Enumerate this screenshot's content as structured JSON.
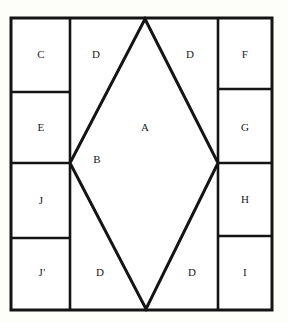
{
  "figure": {
    "type": "geometric-partition-diagram",
    "background_color": "#fdfdfa",
    "stroke_color": "#141414",
    "label_color": "#1a1a1a",
    "outer_border": {
      "x": 11,
      "y": 18,
      "width": 261,
      "height": 292,
      "stroke_width": 3
    },
    "inner_stroke_width": 2.6
  },
  "rhombus": {
    "name": "inscribed-rhombus",
    "top_vertex": {
      "x": 145,
      "y": 19
    },
    "right_vertex": {
      "x": 218,
      "y": 163
    },
    "bottom_vertex": {
      "x": 146,
      "y": 309
    },
    "left_vertex": {
      "x": 70,
      "y": 163
    }
  },
  "columns": {
    "left_divider_x": 70,
    "right_divider_x": 218
  },
  "regions": [
    {
      "id": "A",
      "label": "A",
      "label_x": 145,
      "label_y": 128,
      "role": "rhombus-upper-interior"
    },
    {
      "id": "B",
      "label": "B",
      "label_x": 97,
      "label_y": 160,
      "role": "rhombus-left-interior"
    },
    {
      "id": "C",
      "label": "C",
      "label_x": 41,
      "label_y": 55,
      "role": "left-column-cell-1"
    },
    {
      "id": "E",
      "label": "E",
      "label_x": 41,
      "label_y": 128,
      "role": "left-column-cell-2"
    },
    {
      "id": "J",
      "label": "J",
      "label_x": 41,
      "label_y": 201,
      "role": "left-column-cell-3"
    },
    {
      "id": "Jp",
      "label": "J'",
      "label_x": 42,
      "label_y": 273,
      "role": "left-column-cell-4"
    },
    {
      "id": "F",
      "label": "F",
      "label_x": 245,
      "label_y": 55,
      "role": "right-column-cell-1"
    },
    {
      "id": "G",
      "label": "G",
      "label_x": 245,
      "label_y": 128,
      "role": "right-column-cell-2"
    },
    {
      "id": "H",
      "label": "H",
      "label_x": 245,
      "label_y": 200,
      "role": "right-column-cell-3"
    },
    {
      "id": "I",
      "label": "I",
      "label_x": 245,
      "label_y": 273,
      "role": "right-column-cell-4"
    },
    {
      "id": "D1",
      "label": "D",
      "label_x": 96,
      "label_y": 55,
      "role": "corner-top-left"
    },
    {
      "id": "D2",
      "label": "D",
      "label_x": 190,
      "label_y": 55,
      "role": "corner-top-right"
    },
    {
      "id": "D3",
      "label": "D",
      "label_x": 100,
      "label_y": 273,
      "role": "corner-bottom-left"
    },
    {
      "id": "D4",
      "label": "D",
      "label_x": 192,
      "label_y": 273,
      "role": "corner-bottom-right"
    }
  ],
  "dividers": {
    "left_column_horizontal_y": [
      92,
      163,
      238
    ],
    "right_column_horizontal_y": [
      89,
      163,
      236
    ]
  }
}
